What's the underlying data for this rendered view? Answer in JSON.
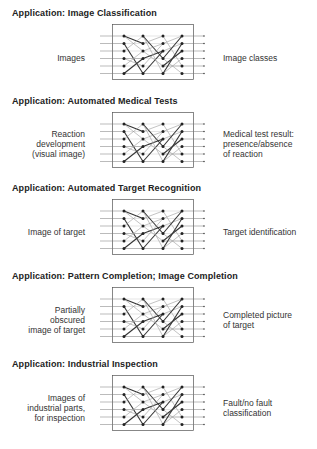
{
  "sections": [
    {
      "title": "Application:  Image Classification",
      "input_label": "Images",
      "output_label": "Image classes"
    },
    {
      "title": "Application:  Automated Medical Tests",
      "input_label": "Reaction\ndevelopment\n(visual image)",
      "output_label": "Medical test result:\npresence/absence\nof reaction"
    },
    {
      "title": "Application:  Automated Target Recognition",
      "input_label": "Image of target",
      "output_label": "Target identification"
    },
    {
      "title": "Application:  Pattern Completion; Image Completion",
      "input_label": "Partially\nobscured\nimage of target",
      "output_label": "Completed picture\nof target"
    },
    {
      "title": "Application:  Industrial Inspection",
      "input_label": "Images of\nindustrial parts,\nfor inspection",
      "output_label": "Fault/no fault\nclassification"
    }
  ],
  "network": {
    "layers": 4,
    "nodes_per_layer": 6,
    "inputs": 6,
    "outputs": 6,
    "line_color": "#333333",
    "faint_line_color": "#9a9a9a"
  }
}
